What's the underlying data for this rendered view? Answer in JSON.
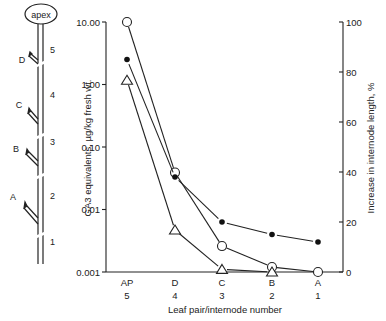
{
  "chart_data": {
    "type": "line",
    "title": "",
    "xlabel": "Leaf pair/internode number",
    "ylabel_left": "GA3 equivalents, µg/kg fresh wt.",
    "ylabel_right": "Increase in internode length, %",
    "categories": [
      {
        "leaf": "AP",
        "internode": "5"
      },
      {
        "leaf": "D",
        "internode": "4"
      },
      {
        "leaf": "C",
        "internode": "3"
      },
      {
        "leaf": "B",
        "internode": "2"
      },
      {
        "leaf": "A",
        "internode": "1"
      }
    ],
    "left_axis": {
      "scale": "log",
      "ylim": [
        0.001,
        10
      ],
      "ticks": [
        "10.00",
        "1.00",
        "0.10",
        "0.01",
        "0.001"
      ]
    },
    "right_axis": {
      "scale": "linear",
      "ylim": [
        0,
        100
      ],
      "ticks": [
        "100",
        "80",
        "60",
        "40",
        "20",
        "0"
      ]
    },
    "series": [
      {
        "name": "open-circle",
        "marker": "open-circle",
        "axis": "left",
        "values": [
          10.0,
          0.039,
          0.0026,
          0.0012,
          0.001
        ]
      },
      {
        "name": "triangle",
        "marker": "open-triangle",
        "axis": "left",
        "values": [
          1.17,
          0.0047,
          0.0011,
          0.001,
          null
        ]
      },
      {
        "name": "filled-circle",
        "marker": "filled-circle",
        "axis": "right",
        "values": [
          85,
          38,
          20,
          15,
          12
        ]
      }
    ],
    "grid": false,
    "legend": "none"
  },
  "diagram": {
    "apex_label": "apex",
    "leaf_labels": [
      "D",
      "C",
      "B",
      "A"
    ],
    "internode_labels": [
      "5",
      "4",
      "3",
      "2",
      "1"
    ]
  }
}
